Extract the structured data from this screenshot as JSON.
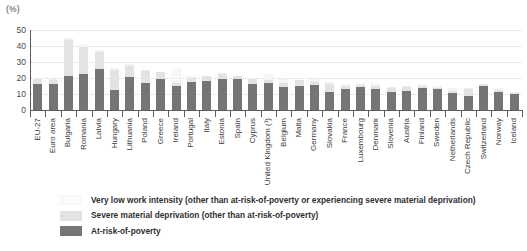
{
  "unit_label": "(%)",
  "chart_data": {
    "type": "bar",
    "subtype": "stacked-bar",
    "title": "",
    "xlabel": "",
    "ylabel": "(%)",
    "ylim": [
      0,
      50
    ],
    "yticks": [
      50,
      40,
      30,
      20,
      10,
      0
    ],
    "grid": true,
    "legend_position": "bottom-left",
    "categories": [
      "EU-27",
      "Euro area",
      "Bulgaria",
      "Romania",
      "Latvia",
      "Hungary",
      "Lithuania",
      "Poland",
      "Greece",
      "Ireland",
      "Portugal",
      "Italy",
      "Estonia",
      "Spain",
      "Cyprus",
      "United Kingdom (¹)",
      "Belgium",
      "Malta",
      "Germany",
      "Slovakia",
      "France",
      "Luxembourg",
      "Denmark",
      "Slovenia",
      "Austria",
      "Finland",
      "Sweden",
      "Netherlands",
      "Czech Republic",
      "Switzerland",
      "Norway",
      "Iceland"
    ],
    "series": [
      {
        "name": "At-risk-of-poverty",
        "color": "#757575",
        "values": [
          16.5,
          16.0,
          21.5,
          22.5,
          25.5,
          12.5,
          20.5,
          17.0,
          19.5,
          15.0,
          17.5,
          18.0,
          19.5,
          19.5,
          16.0,
          17.0,
          14.5,
          15.0,
          15.5,
          11.0,
          13.0,
          14.5,
          13.0,
          11.5,
          12.0,
          13.5,
          13.0,
          10.5,
          9.0,
          15.0,
          11.5,
          10.0
        ]
      },
      {
        "name": "Severe material deprivation (other than at-risk-of-poverty)",
        "color": "#e3e3e3",
        "values": [
          3.0,
          2.5,
          22.0,
          17.0,
          11.0,
          12.5,
          7.0,
          7.5,
          4.0,
          2.0,
          2.5,
          3.0,
          3.0,
          1.5,
          3.5,
          2.0,
          2.5,
          3.5,
          2.0,
          5.5,
          2.0,
          1.0,
          2.0,
          2.0,
          2.5,
          1.5,
          1.0,
          1.5,
          4.0,
          1.0,
          1.0,
          0.5
        ]
      },
      {
        "name": "Very low work intensity (other than at-risk-of-poverty or experiencing severe material deprivation)",
        "color": "#f8f8f8",
        "values": [
          0.8,
          0.8,
          1.5,
          1.5,
          1.0,
          1.0,
          1.0,
          0.8,
          0.5,
          8.5,
          1.5,
          0.5,
          0.8,
          0.5,
          0.5,
          3.5,
          2.5,
          0.5,
          2.0,
          1.0,
          1.5,
          1.5,
          2.0,
          0.8,
          0.8,
          1.5,
          1.0,
          1.5,
          0.8,
          0.5,
          1.0,
          0.5
        ]
      }
    ]
  },
  "legend": [
    {
      "label": "Very low work intensity (other than at-risk-of-poverty or experiencing severe material deprivation)",
      "swatch_class": "sw-vlwi",
      "color": "#f8f8f8"
    },
    {
      "label": "Severe material deprivation (other than at-risk-of-poverty)",
      "swatch_class": "sw-smd",
      "color": "#e3e3e3"
    },
    {
      "label": "At-risk-of-poverty",
      "swatch_class": "sw-arop",
      "color": "#757575"
    }
  ]
}
